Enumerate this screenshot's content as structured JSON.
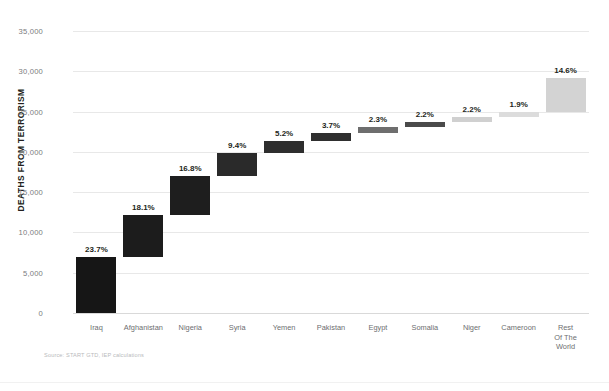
{
  "chart_data": {
    "type": "bar",
    "subtype": "waterfall",
    "title": "",
    "xlabel": "",
    "ylabel": "DEATHS FROM TERRORISM",
    "ylim": [
      0,
      35000
    ],
    "ytick_step": 5000,
    "ytick_labels": [
      "0",
      "5,000",
      "10,000",
      "15,000",
      "20,000",
      "25,000",
      "30,000",
      "35,000"
    ],
    "ytick_values": [
      0,
      5000,
      10000,
      15000,
      20000,
      25000,
      30000,
      35000
    ],
    "grid": true,
    "legend": false,
    "categories": [
      "Iraq",
      "Afghanistan",
      "Nigeria",
      "Syria",
      "Yemen",
      "Pakistan",
      "Egypt",
      "Somalia",
      "Niger",
      "Cameroon",
      "Rest\nOf The\nWorld"
    ],
    "value_labels": [
      "23.7%",
      "18.1%",
      "16.8%",
      "9.4%",
      "5.2%",
      "3.7%",
      "2.3%",
      "2.2%",
      "2.2%",
      "1.9%",
      "14.6%"
    ],
    "percent_values": [
      23.7,
      18.1,
      16.8,
      9.4,
      5.2,
      3.7,
      2.3,
      2.2,
      2.2,
      1.9,
      14.6
    ],
    "values": [
      6900,
      5270,
      4890,
      2740,
      1510,
      1080,
      670,
      640,
      640,
      550,
      4250
    ],
    "bar_base": [
      0,
      6900,
      12170,
      17060,
      19800,
      21310,
      22390,
      23060,
      23700,
      24340,
      24890
    ],
    "bar_top": [
      6900,
      12170,
      17060,
      19800,
      21310,
      22390,
      23060,
      23700,
      24340,
      24890,
      29140
    ],
    "bar_colors": [
      "#161616",
      "#1c1c1c",
      "#1e1e1e",
      "#2a2a2a",
      "#2e2e2e",
      "#2f2f2f",
      "#6e6e6e",
      "#4a4a4a",
      "#d0d0d0",
      "#dcdcdc",
      "#d3d3d3"
    ],
    "source_note": "Source: START GTD, IEP calculations",
    "axis_label_color": "#7a7b7d",
    "gridline_color": "#e8e8e8",
    "background": "#ffffff"
  },
  "footer": {
    "source": "Source: START GTD, IEP calculations"
  }
}
